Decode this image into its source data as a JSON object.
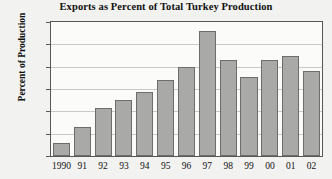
{
  "chart_data": {
    "type": "bar",
    "title": "Exports as Percent of Total Turkey Production",
    "xlabel": "",
    "ylabel": "Percent of Production",
    "categories": [
      "1990",
      "91",
      "92",
      "93",
      "94",
      "95",
      "96",
      "97",
      "98",
      "99",
      "00",
      "01",
      "02"
    ],
    "values": [
      1.2,
      2.6,
      4.3,
      5.0,
      5.7,
      6.8,
      8.0,
      11.2,
      8.6,
      7.1,
      8.6,
      9.0,
      7.6
    ],
    "ylim": [
      0,
      12
    ],
    "yticks": [
      0,
      2,
      4,
      6,
      8,
      10,
      12
    ],
    "ytick_labels": [
      "0",
      "2",
      "4",
      "6",
      "8",
      "10",
      "12"
    ],
    "grid": true,
    "legend": false,
    "legend_position": "none",
    "bar_color": "#a9a9a7",
    "bar_border_color": "#6d6d6b",
    "plot_background": "#fbfbfa",
    "figure_background": "#f2f2f0",
    "axis_color": "#585858",
    "grid_color": "#c9c9c7",
    "text_color": "#111111"
  }
}
